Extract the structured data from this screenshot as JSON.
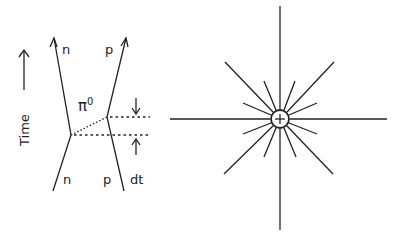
{
  "feynman_diagram": {
    "time_axis_label": "Time",
    "incoming_left_label": "n",
    "incoming_right_label": "p",
    "outgoing_left_label": "n",
    "outgoing_right_label": "p",
    "exchange_particle": "π",
    "exchange_particle_superscript": "0",
    "interval_label": "dt"
  },
  "field_diagram": {
    "central_charge_symbol": "+",
    "field_lines": 16
  }
}
